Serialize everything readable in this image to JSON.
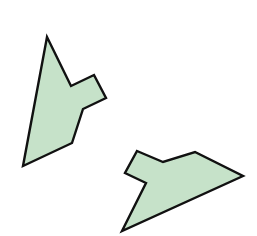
{
  "canvas": {
    "width": 257,
    "height": 236,
    "background": "#ffffff"
  },
  "style": {
    "fill": "#c6e2c9",
    "stroke": "#111111",
    "stroke_width": 2.4
  },
  "shapes": [
    {
      "name": "polygon-left",
      "points": "47,37 71,86 94,75 106,98 83,109 72,143 23,166"
    },
    {
      "name": "polygon-right",
      "points": "137,151 163,162 195,152 243,176 122,231 146,183 125,173"
    }
  ]
}
